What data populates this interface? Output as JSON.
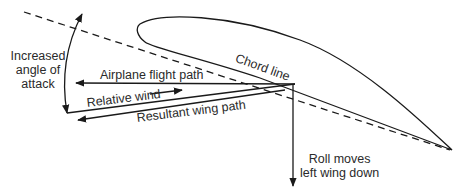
{
  "labels": {
    "angle_of_attack": [
      "Increased",
      "angle of",
      "attack"
    ],
    "chord_line": "Chord line",
    "airplane_flight_path": "Airplane flight path",
    "relative_wind": "Relative wind",
    "resultant_wing_path": "Resultant wing path",
    "roll": [
      "Roll moves",
      "left wing down"
    ]
  },
  "colors": {
    "line": "#1a1a1a",
    "text": "#2a2a2a",
    "background": "#ffffff"
  }
}
